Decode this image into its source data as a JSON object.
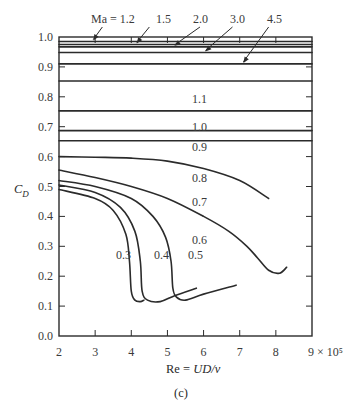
{
  "chart_data": {
    "type": "line",
    "title": "",
    "caption": "(c)",
    "xlabel": "Re = UD/ν",
    "xlabel_parts": {
      "prefix": "Re = ",
      "italic": "UD/ν"
    },
    "x_scale_suffix": "× 10⁵",
    "ylabel": "C_D",
    "ylabel_parts": {
      "main": "C",
      "sub": "D"
    },
    "xlim": [
      2,
      9
    ],
    "ylim": [
      0.0,
      1.0
    ],
    "x_ticks": [
      2,
      3,
      4,
      5,
      6,
      7,
      8,
      9
    ],
    "x_tick_labels": [
      "2",
      "3",
      "4",
      "5",
      "6",
      "7",
      "8",
      "9 × 10⁵"
    ],
    "y_ticks": [
      0.0,
      0.1,
      0.2,
      0.3,
      0.4,
      0.5,
      0.6,
      0.7,
      0.8,
      0.9,
      1.0
    ],
    "y_tick_labels": [
      "0.0",
      "0.1",
      "0.2",
      "0.3",
      "0.4",
      "0.5",
      "0.6",
      "0.7",
      "0.8",
      "0.9",
      "1.0"
    ],
    "grid": false,
    "legend": "inline curve labels",
    "series_label_prefix": "Ma = ",
    "series": [
      {
        "name": "1.2",
        "mach": 1.2,
        "x": [
          2,
          9
        ],
        "y": [
          0.985,
          0.985
        ]
      },
      {
        "name": "1.5",
        "mach": 1.5,
        "x": [
          2,
          9
        ],
        "y": [
          0.975,
          0.975
        ]
      },
      {
        "name": "2.0",
        "mach": 2.0,
        "x": [
          2,
          9
        ],
        "y": [
          0.967,
          0.967
        ]
      },
      {
        "name": "3.0",
        "mach": 3.0,
        "x": [
          2,
          9
        ],
        "y": [
          0.948,
          0.948
        ]
      },
      {
        "name": "4.5",
        "mach": 4.5,
        "x": [
          2,
          9
        ],
        "y": [
          0.91,
          0.91
        ]
      },
      {
        "name": "1.1",
        "mach": 1.1,
        "x": [
          2,
          9
        ],
        "y": [
          0.853,
          0.853
        ]
      },
      {
        "name": "1.0",
        "mach": 1.0,
        "x": [
          2,
          9
        ],
        "y": [
          0.753,
          0.753
        ]
      },
      {
        "name": "0.9",
        "mach": 0.9,
        "x": [
          2,
          9
        ],
        "y": [
          0.687,
          0.687
        ]
      },
      {
        "name": "0.8",
        "mach": 0.8,
        "x": [
          2,
          9
        ],
        "y": [
          0.653,
          0.653
        ]
      },
      {
        "name": "0.7",
        "mach": 0.7,
        "x": [
          2,
          3,
          4,
          5,
          6,
          7,
          7.8
        ],
        "y": [
          0.6,
          0.598,
          0.595,
          0.585,
          0.56,
          0.52,
          0.46
        ]
      },
      {
        "name": "0.6",
        "mach": 0.6,
        "x": [
          2,
          3,
          4,
          5,
          6,
          6.7,
          7.2,
          7.5,
          7.8,
          8.1,
          8.3
        ],
        "y": [
          0.555,
          0.53,
          0.5,
          0.46,
          0.4,
          0.35,
          0.3,
          0.26,
          0.22,
          0.21,
          0.23
        ]
      },
      {
        "name": "0.5",
        "mach": 0.5,
        "x": [
          2,
          3,
          4,
          4.6,
          4.95,
          5.1,
          5.15,
          5.25,
          5.5,
          6.0,
          6.9
        ],
        "y": [
          0.52,
          0.5,
          0.46,
          0.4,
          0.33,
          0.25,
          0.16,
          0.13,
          0.12,
          0.14,
          0.17
        ]
      },
      {
        "name": "0.4",
        "mach": 0.4,
        "x": [
          2,
          3,
          3.7,
          4.1,
          4.25,
          4.3,
          4.45,
          4.8,
          5.2,
          5.8
        ],
        "y": [
          0.505,
          0.48,
          0.43,
          0.35,
          0.25,
          0.15,
          0.12,
          0.115,
          0.135,
          0.16
        ]
      },
      {
        "name": "0.3",
        "mach": 0.3,
        "x": [
          2,
          3,
          3.5,
          3.85,
          3.95,
          4.0,
          4.1,
          4.25,
          4.35
        ],
        "y": [
          0.49,
          0.46,
          0.42,
          0.34,
          0.25,
          0.15,
          0.12,
          0.115,
          0.12
        ]
      }
    ]
  },
  "annotations": {
    "top_labels": [
      "Ma = 1.2",
      "1.5",
      "2.0",
      "3.0",
      "4.5"
    ],
    "inline_labels": [
      "1.1",
      "1.0",
      "0.9",
      "0.8",
      "0.7",
      "0.6",
      "0.5",
      "0.4",
      "0.3"
    ]
  }
}
